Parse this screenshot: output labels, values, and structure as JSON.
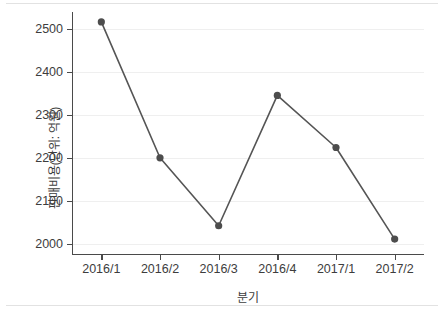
{
  "chart_data": {
    "type": "line",
    "title": "",
    "xlabel": "분기",
    "ylabel": "판매비용(단위: 억원)",
    "categories": [
      "2016/1",
      "2016/2",
      "2016/3",
      "2016/4",
      "2017/1",
      "2017/2"
    ],
    "values": [
      2517,
      2201,
      2043,
      2346,
      2225,
      2012
    ],
    "series": [
      {
        "name": "판매비용",
        "values": [
          2517,
          2201,
          2043,
          2346,
          2225,
          2012
        ]
      }
    ],
    "ylim": [
      1975,
      2540
    ],
    "yticks": [
      2000,
      2100,
      2200,
      2300,
      2400,
      2500
    ],
    "ytick_labels": [
      "2000",
      "2100",
      "2200",
      "2300",
      "2400",
      "2500"
    ],
    "xtick_labels": [
      "2016/1",
      "2016/2",
      "2016/3",
      "2016/4",
      "2017/1",
      "2017/2"
    ],
    "grid": true,
    "grid_axis": "y",
    "legend": false,
    "legend_position": "none",
    "marker": "circle",
    "line_color": "#555555",
    "marker_color": "#4d4d4d",
    "grid_color": "#efefef",
    "axis_color": "#4a4a4a",
    "background_color": "#ffffff"
  }
}
